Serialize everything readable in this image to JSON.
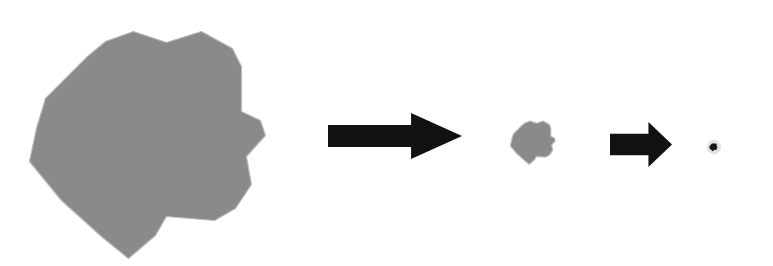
{
  "figure": {
    "background_color": "#ffffff",
    "width": 773,
    "height": 266
  },
  "palette": {
    "blob_fill": "#8a8a8a",
    "blob_outline": "#b9b9b9",
    "arrow_fill": "#111111",
    "dot_fill": "#151515",
    "dot_halo": "#9a9a9a",
    "background": "#ffffff"
  },
  "shapes": {
    "blob_outline_points": "150,23 183,34 218,23 249,40 258,58 258,103 277,112 282,127 263,148 268,176 252,200 231,212 183,208 172,227 145,250 118,228 78,192 46,153 53,120 62,90 104,48 122,33",
    "arrow_path": "0,14 62,14 62,0 100,27 62,54 62,40 0,40"
  },
  "stages": [
    {
      "id": "stage-large",
      "label": "large-blob",
      "order": 1,
      "center_x": 164,
      "center_y": 136,
      "scale": 1.0,
      "approx_width_px": 236,
      "approx_height_px": 227,
      "fill": "#8a8a8a"
    },
    {
      "id": "stage-medium",
      "label": "medium-blob",
      "order": 2,
      "center_x": 536,
      "center_y": 141,
      "scale": 0.19,
      "approx_width_px": 45,
      "approx_height_px": 44,
      "fill": "#8a8a8a"
    },
    {
      "id": "stage-small",
      "label": "small-dot",
      "order": 3,
      "center_x": 714,
      "center_y": 147,
      "scale": 0.035,
      "approx_width_px": 8,
      "approx_height_px": 8,
      "fill": "#151515"
    }
  ],
  "arrows": [
    {
      "id": "arrow-one",
      "label": "reduction-arrow-1",
      "direction": "right",
      "x": 328,
      "y": 113,
      "width": 134,
      "height": 46,
      "fill": "#111111"
    },
    {
      "id": "arrow-two",
      "label": "reduction-arrow-2",
      "direction": "right",
      "x": 610,
      "y": 122,
      "width": 62,
      "height": 45,
      "fill": "#111111"
    }
  ]
}
